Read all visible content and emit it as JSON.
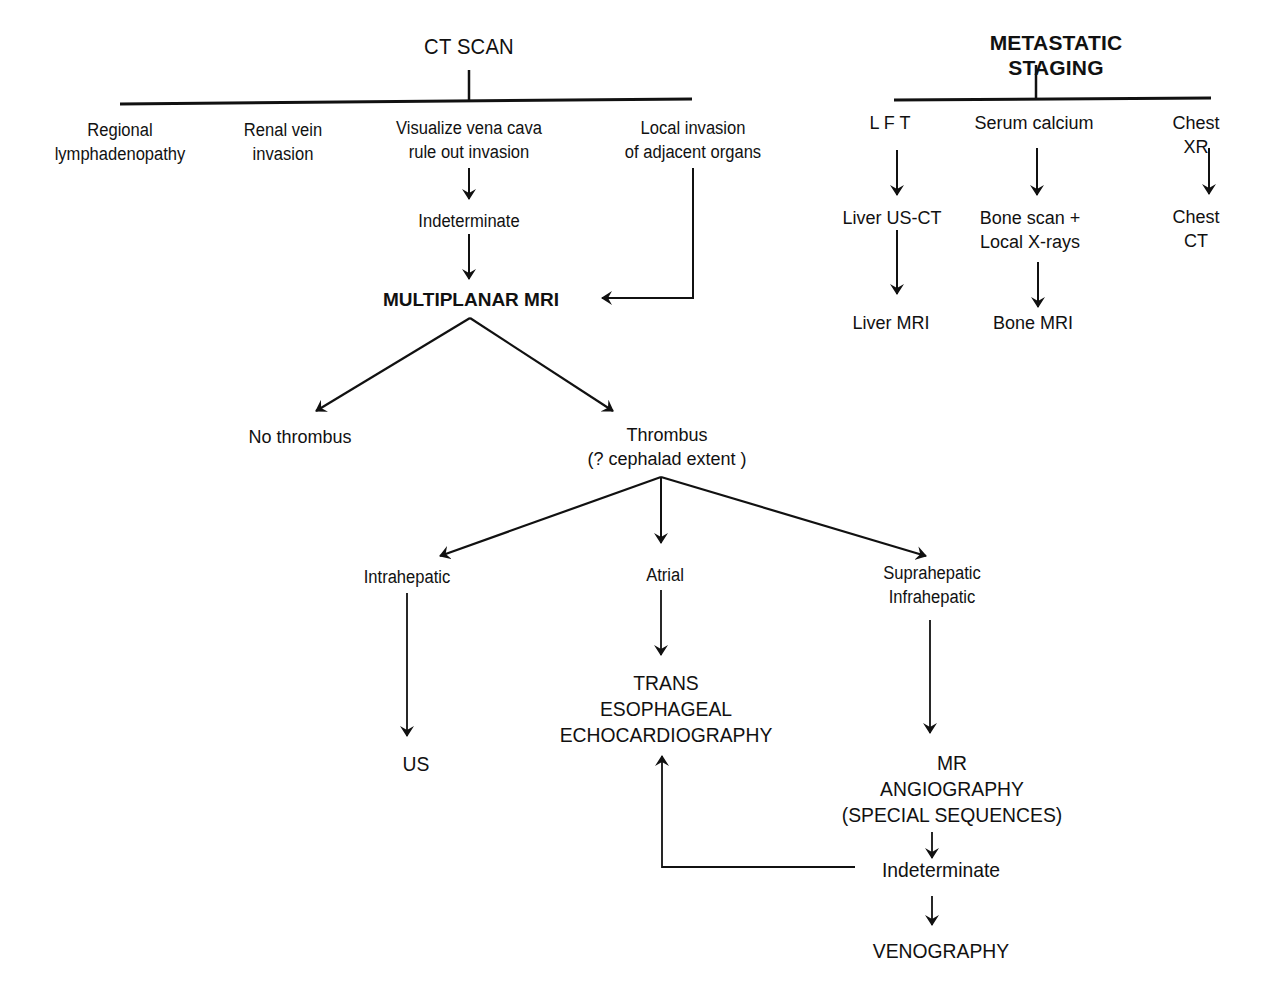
{
  "left_tree": {
    "root": "CT SCAN",
    "branches": [
      "Regional\nlymphadenopathy",
      "Renal vein\ninvasion",
      "Visualize vena cava\nrule out invasion",
      "Local invasion\nof adjacent organs"
    ],
    "indeterminate_1": "Indeterminate",
    "mri": "MULTIPLANAR MRI",
    "no_thrombus": "No thrombus",
    "thrombus": "Thrombus\n(? cephalad extent )",
    "intrahepatic": "Intrahepatic",
    "atrial": "Atrial",
    "supra_infra": "Suprahepatic\nInfrahepatic",
    "us": "US",
    "tee": "TRANS\nESOPHAGEAL\nECHOCARDIOGRAPHY",
    "mra": "MR\nANGIOGRAPHY\n(SPECIAL SEQUENCES)",
    "indeterminate_2": "Indeterminate",
    "venography": "VENOGRAPHY"
  },
  "right_tree": {
    "root": "METASTATIC STAGING",
    "branches": [
      "L F T",
      "Serum calcium",
      "Chest XR"
    ],
    "level2": [
      "Liver US-CT",
      "Bone scan +\nLocal X-rays",
      "Chest CT"
    ],
    "level3": [
      "Liver MRI",
      "Bone MRI"
    ]
  },
  "colors": {
    "ink": "#111111",
    "background": "#ffffff"
  }
}
